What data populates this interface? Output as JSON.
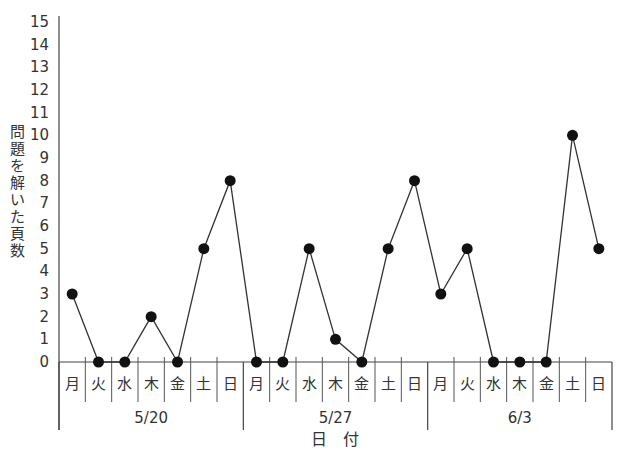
{
  "chart_data": {
    "type": "line",
    "title": "",
    "xlabel": "日 付",
    "ylabel": "問題を解いた頁数",
    "ylim": [
      0,
      15
    ],
    "y_ticks": [
      0,
      1,
      2,
      3,
      4,
      5,
      6,
      7,
      8,
      9,
      10,
      11,
      12,
      13,
      14,
      15
    ],
    "grid": false,
    "legend": null,
    "week_groups": [
      {
        "label": "5/20",
        "days": [
          "月",
          "火",
          "水",
          "木",
          "金",
          "土",
          "日"
        ]
      },
      {
        "label": "5/27",
        "days": [
          "月",
          "火",
          "水",
          "木",
          "金",
          "土",
          "日"
        ]
      },
      {
        "label": "6/3",
        "days": [
          "月",
          "火",
          "水",
          "木",
          "金",
          "土",
          "日"
        ]
      }
    ],
    "categories": [
      "5/20 月",
      "5/20 火",
      "5/20 水",
      "5/20 木",
      "5/20 金",
      "5/20 土",
      "5/20 日",
      "5/27 月",
      "5/27 火",
      "5/27 水",
      "5/27 木",
      "5/27 金",
      "5/27 土",
      "5/27 日",
      "6/3 月",
      "6/3 火",
      "6/3 水",
      "6/3 木",
      "6/3 金",
      "6/3 土",
      "6/3 日"
    ],
    "series": [
      {
        "name": "問題を解いた頁数",
        "values": [
          3,
          0,
          0,
          2,
          0,
          5,
          8,
          0,
          0,
          5,
          1,
          0,
          5,
          8,
          3,
          5,
          0,
          0,
          0,
          10,
          5
        ],
        "marker": "filled-circle",
        "color": "#111111"
      }
    ]
  },
  "axis": {
    "ylabel_chars": [
      "問",
      "題",
      "を",
      "解",
      "い",
      "た",
      "頁",
      "数"
    ],
    "xlabel": "日　付"
  }
}
